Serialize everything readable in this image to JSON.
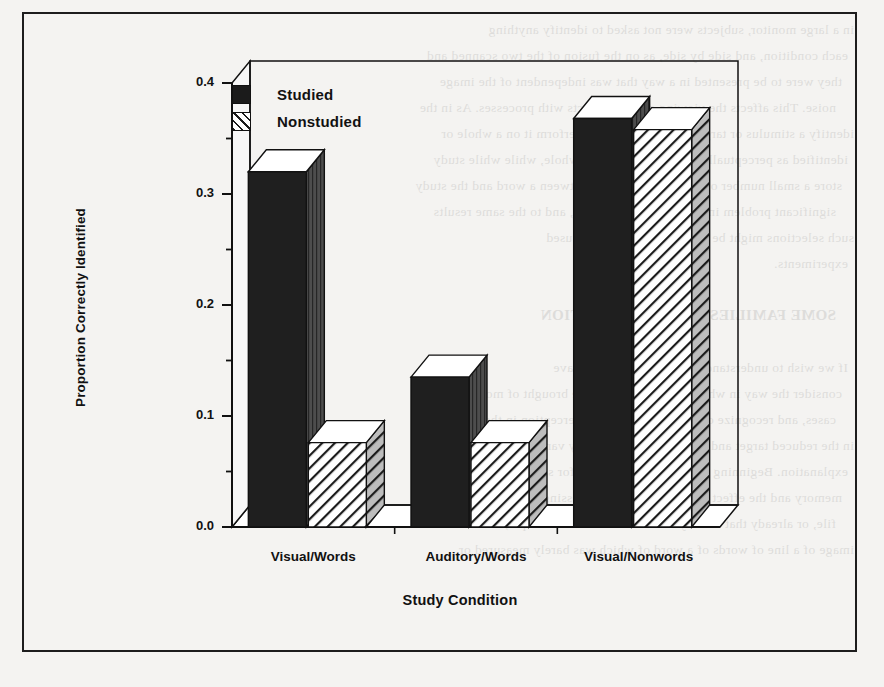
{
  "figure": {
    "frame_color": "#1d1d1d",
    "background_color": "#f4f3f1"
  },
  "legend": {
    "items": [
      {
        "label": "Studied",
        "swatch": "solid-black-square",
        "color": "#1b1b1b"
      },
      {
        "label": "Nonstudied",
        "swatch": "diagonal-hatch-square",
        "color": "#1b1b1b"
      }
    ]
  },
  "bleed_text": {
    "lines": [
      "in a large monitor, subjects were not asked to identify anything",
      "each condition, and side by side, as on the fusion of the two scanned and",
      "they were to be presented in a way that was independent of the image",
      "noise. This affects the viewing of these effects with processes. As in the",
      "identify a stimulus or target or viewed list and perform it on a whole or",
      "identified as perceptually or semantically as a whole, while while study",
      "store a small number of items. The pictures between a word and the study",
      "significant problem in Jacoby 1983, in nature, and to the same results",
      "such selections might be sustained by the words used",
      "experiments.",
      "",
      "SOME FAMILIES OF AN EXPLANATION",
      "",
      "If we wish to understand these words, and we have",
      "consider the way in which the size of these are brought of most",
      "cases, and recognize over a method and the perception in the processes",
      "in the reduced target and again is useful to a very varied",
      "explanation. Beginning with some the variable for several recall",
      "memory and the effect of the time of the processing was obtained in the",
      "file, or already that already been identified. For example, the visual",
      "image of a line of words of a word of which was barely measured or"
    ]
  },
  "chart_data": {
    "type": "bar",
    "title": "",
    "xlabel": "Study Condition",
    "ylabel": "Proportion Correctly Identified",
    "categories": [
      "Visual/Words",
      "Auditory/Words",
      "Visual/Nonwords"
    ],
    "series": [
      {
        "name": "Studied",
        "values": [
          0.32,
          0.135,
          0.368
        ]
      },
      {
        "name": "Nonstudied",
        "values": [
          0.076,
          0.076,
          0.358
        ]
      }
    ],
    "ylim": [
      0.0,
      0.4
    ],
    "ytick_values": [
      0.0,
      0.1,
      0.2,
      0.3,
      0.4
    ],
    "ytick_labels": [
      "0.0",
      "0.1",
      "0.2",
      "0.3",
      "0.4"
    ],
    "yminor_tick_values": [
      0.05,
      0.15,
      0.25,
      0.35
    ],
    "grid": false,
    "legend_position": "upper-left-inside",
    "style": "3d-extruded-bars"
  }
}
